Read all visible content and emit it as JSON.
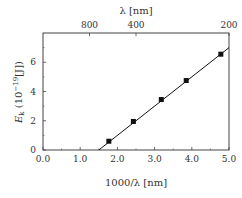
{
  "chart_data": {
    "type": "scatter",
    "title": "",
    "xlabel": "1000/λ [nm]",
    "ylabel": "E_k (10^-19 [J])",
    "ylabel_parts": {
      "main": "E",
      "sub": "k",
      "paren_open": " (10",
      "sup": "−19",
      "rest": "[J])"
    },
    "top_xlabel": "λ [nm]",
    "xlim": [
      0,
      5
    ],
    "ylim": [
      0,
      8
    ],
    "x_ticks": [
      0,
      1,
      2,
      3,
      4,
      5
    ],
    "x_tick_labels": [
      "0.0",
      "1.0",
      "2.0",
      "3.0",
      "4.0",
      "5.0"
    ],
    "y_ticks": [
      0,
      2,
      4,
      6
    ],
    "y_tick_labels": [
      "0",
      "2",
      "4",
      "6"
    ],
    "top_ticks": [
      {
        "pos": 1.25,
        "label": "800"
      },
      {
        "pos": 2.5,
        "label": "400"
      },
      {
        "pos": 5.0,
        "label": "200"
      }
    ],
    "grid": false,
    "series": [
      {
        "name": "measured",
        "marker": "square",
        "x": [
          1.77,
          2.43,
          3.18,
          3.85,
          4.78
        ],
        "y": [
          0.6,
          1.95,
          3.45,
          4.75,
          6.55
        ]
      },
      {
        "name": "linear fit",
        "marker": "line",
        "x": [
          1.5,
          5.0
        ],
        "y": [
          0.0,
          7.0
        ]
      }
    ]
  },
  "colors": {
    "axis": "#444444",
    "data": "#111111",
    "text": "#333333"
  }
}
